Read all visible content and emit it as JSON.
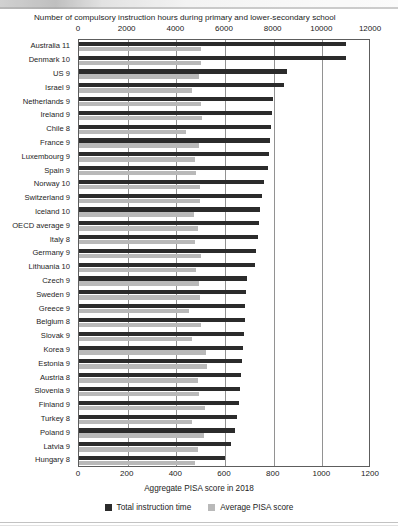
{
  "chart_data": {
    "type": "bar",
    "orientation": "horizontal",
    "title": "Number of compulsory instruction hours during primary and lower-secondary school",
    "xlabel": "Aggregate PISA score in 2018",
    "ylabel": "",
    "grid": true,
    "legend_position": "bottom",
    "top_axis": {
      "label": "Number of compulsory instruction hours during primary and lower-secondary school",
      "ticks": [
        0,
        2000,
        4000,
        6000,
        8000,
        10000,
        12000
      ],
      "range": [
        0,
        12000
      ],
      "series": "Total instruction time"
    },
    "bottom_axis": {
      "label": "Aggregate PISA score in 2018",
      "ticks": [
        0,
        200,
        400,
        600,
        800,
        1000,
        1200
      ],
      "range": [
        0,
        1200
      ],
      "series": "Average PISA score"
    },
    "categories": [
      "Australia  11",
      "Denmark  10",
      "US  9",
      "Israel  9",
      "Netherlands  9",
      "Ireland  9",
      "Chile  8",
      "France  9",
      "Luxembourg  9",
      "Spain  9",
      "Norway  10",
      "Switzerland  9",
      "Iceland  10",
      "OECD average  9",
      "Italy  8",
      "Germany  9",
      "Lithuania  10",
      "Czech  9",
      "Sweden  9",
      "Greece  9",
      "Belgium  8",
      "Slovak  9",
      "Korea  9",
      "Estonia  9",
      "Austria  8",
      "Slovenia  9",
      "Finland  9",
      "Turkey  8",
      "Poland  9",
      "Latvia  9",
      "Hungary  8"
    ],
    "series": [
      {
        "name": "Total instruction time",
        "color": "#2b2b2b",
        "axis": "top",
        "unit": "hours",
        "values": [
          10990,
          10960,
          8530,
          8430,
          7960,
          7930,
          7890,
          7860,
          7820,
          7750,
          7620,
          7540,
          7430,
          7390,
          7340,
          7290,
          7220,
          6900,
          6870,
          6840,
          6810,
          6770,
          6730,
          6700,
          6660,
          6610,
          6570,
          6500,
          6400,
          6250,
          6000
        ]
      },
      {
        "name": "Average PISA score",
        "color": "#b9b9b9",
        "axis": "bottom",
        "unit": "score",
        "values": [
          502,
          501,
          495,
          465,
          503,
          504,
          438,
          493,
          477,
          480,
          497,
          498,
          474,
          488,
          477,
          500,
          482,
          495,
          499,
          453,
          500,
          464,
          520,
          525,
          491,
          495,
          516,
          466,
          512,
          487,
          478
        ]
      }
    ]
  },
  "legend": {
    "items": [
      {
        "label": "Total instruction time",
        "swatch": "dark"
      },
      {
        "label": "Average PISA score",
        "swatch": "light"
      }
    ]
  }
}
